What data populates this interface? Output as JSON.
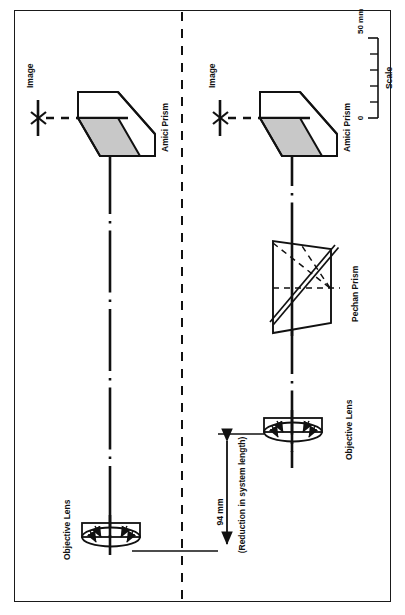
{
  "figure": {
    "kind": "optical-system-comparison-diagram",
    "orientation": "rotated-90-clockwise",
    "border_color": "#1a1a1a",
    "line_color": "#111111",
    "shade_color": "#c8c8c8",
    "background": "#ffffff"
  },
  "divider": {
    "name": "center-dashed-divider",
    "style": "dashed-vertical"
  },
  "systems": [
    {
      "id": "system-top",
      "name": "conventional-system",
      "image_label": "Image",
      "prisms": [
        {
          "type": "amici",
          "label": "Amici Prism"
        }
      ],
      "lens_label": "Objective Lens"
    },
    {
      "id": "system-bottom",
      "name": "pechan-shortened-system",
      "image_label": "Image",
      "prisms": [
        {
          "type": "amici",
          "label": "Amici Prism"
        },
        {
          "type": "pechan",
          "label": "Pechan Prism"
        }
      ],
      "lens_label": "Objective Lens"
    }
  ],
  "dimension": {
    "name": "system-length-reduction",
    "value_label": "94 mm",
    "note_label": "(Reduction in system length)"
  },
  "scale": {
    "title": "Scale",
    "min_label": "0",
    "max_label": "50 mm",
    "ticks": 5
  }
}
